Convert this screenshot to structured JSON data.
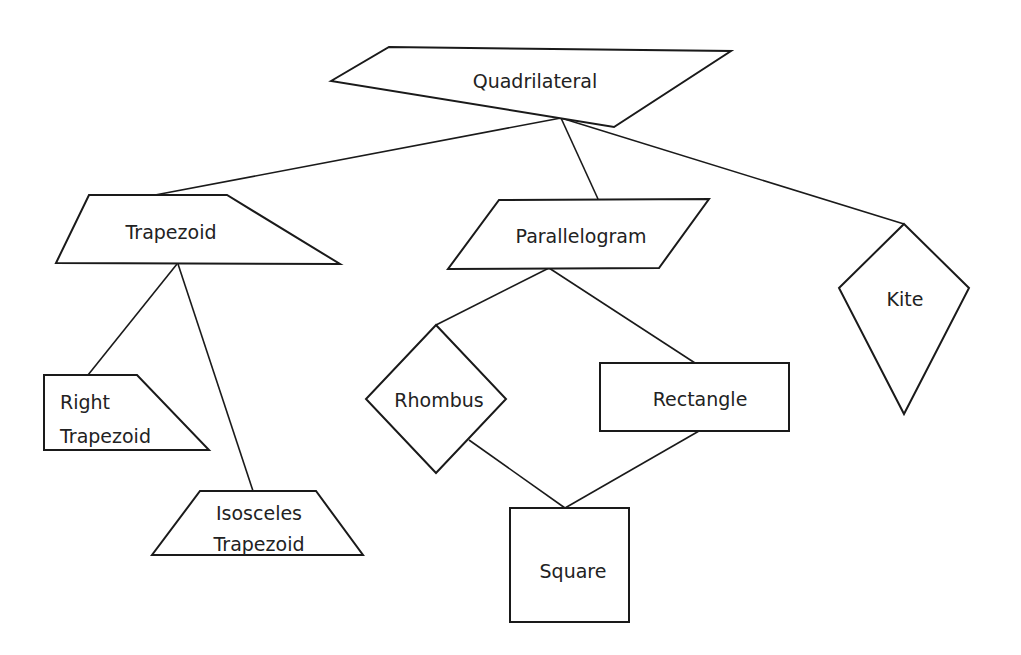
{
  "diagram": {
    "nodes": {
      "quadrilateral": {
        "label": "Quadrilateral"
      },
      "trapezoid": {
        "label": "Trapezoid"
      },
      "parallelogram": {
        "label": "Parallelogram"
      },
      "kite": {
        "label": "Kite"
      },
      "right_trapezoid": {
        "line1": "Right",
        "line2": "Trapezoid"
      },
      "isosceles_trapezoid": {
        "line1": "Isosceles",
        "line2": "Trapezoid"
      },
      "rhombus": {
        "label": "Rhombus"
      },
      "rectangle": {
        "label": "Rectangle"
      },
      "square": {
        "label": "Square"
      }
    },
    "edges": [
      {
        "from": "Quadrilateral",
        "to": "Trapezoid"
      },
      {
        "from": "Quadrilateral",
        "to": "Parallelogram"
      },
      {
        "from": "Quadrilateral",
        "to": "Kite"
      },
      {
        "from": "Trapezoid",
        "to": "Right Trapezoid"
      },
      {
        "from": "Trapezoid",
        "to": "Isosceles Trapezoid"
      },
      {
        "from": "Parallelogram",
        "to": "Rhombus"
      },
      {
        "from": "Parallelogram",
        "to": "Rectangle"
      },
      {
        "from": "Rhombus",
        "to": "Square"
      },
      {
        "from": "Rectangle",
        "to": "Square"
      }
    ],
    "colors": {
      "stroke": "#1a1a1a",
      "fill": "#ffffff",
      "text": "#222222"
    }
  }
}
